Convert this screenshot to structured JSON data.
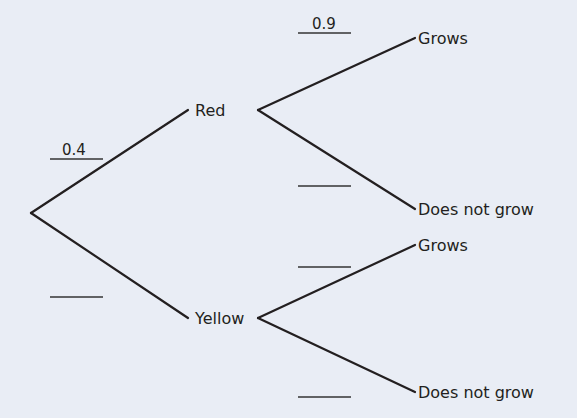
{
  "colors": {
    "background": "#e9edf5",
    "ink": "#231f20",
    "blank_line": "#333333"
  },
  "tree": {
    "root": {
      "x": 31,
      "y": 213
    },
    "first_level": [
      {
        "label": "Red",
        "probability": "0.4",
        "line_end": {
          "x": 188,
          "y": 110
        },
        "label_pos": {
          "x": 195,
          "y": 116
        },
        "prob_blank": {
          "x1": 50,
          "x2": 103,
          "y": 159
        },
        "prob_text_pos": {
          "x": 62,
          "y": 155
        },
        "outcomes": [
          {
            "label": "Grows",
            "probability": "0.9",
            "line_start": {
              "x": 258,
              "y": 110
            },
            "line_end": {
              "x": 415,
              "y": 38
            },
            "label_pos": {
              "x": 418,
              "y": 44
            },
            "prob_blank": {
              "x1": 298,
              "x2": 351,
              "y": 33
            },
            "prob_text_pos": {
              "x": 312,
              "y": 29
            }
          },
          {
            "label": "Does not grow",
            "probability": "",
            "line_start": {
              "x": 258,
              "y": 110
            },
            "line_end": {
              "x": 415,
              "y": 209
            },
            "label_pos": {
              "x": 418,
              "y": 215
            },
            "prob_blank": {
              "x1": 298,
              "x2": 351,
              "y": 186
            },
            "prob_text_pos": {
              "x": 312,
              "y": 182
            }
          }
        ]
      },
      {
        "label": "Yellow",
        "probability": "",
        "line_end": {
          "x": 188,
          "y": 318
        },
        "label_pos": {
          "x": 195,
          "y": 324
        },
        "prob_blank": {
          "x1": 50,
          "x2": 103,
          "y": 297
        },
        "prob_text_pos": {
          "x": 62,
          "y": 293
        },
        "outcomes": [
          {
            "label": "Grows",
            "probability": "",
            "line_start": {
              "x": 258,
              "y": 318
            },
            "line_end": {
              "x": 415,
              "y": 245
            },
            "label_pos": {
              "x": 418,
              "y": 251
            },
            "prob_blank": {
              "x1": 298,
              "x2": 351,
              "y": 267
            },
            "prob_text_pos": {
              "x": 312,
              "y": 263
            }
          },
          {
            "label": "Does not grow",
            "probability": "",
            "line_start": {
              "x": 258,
              "y": 318
            },
            "line_end": {
              "x": 415,
              "y": 392
            },
            "label_pos": {
              "x": 418,
              "y": 398
            },
            "prob_blank": {
              "x1": 298,
              "x2": 351,
              "y": 397
            },
            "prob_text_pos": {
              "x": 312,
              "y": 393
            }
          }
        ]
      }
    ]
  }
}
